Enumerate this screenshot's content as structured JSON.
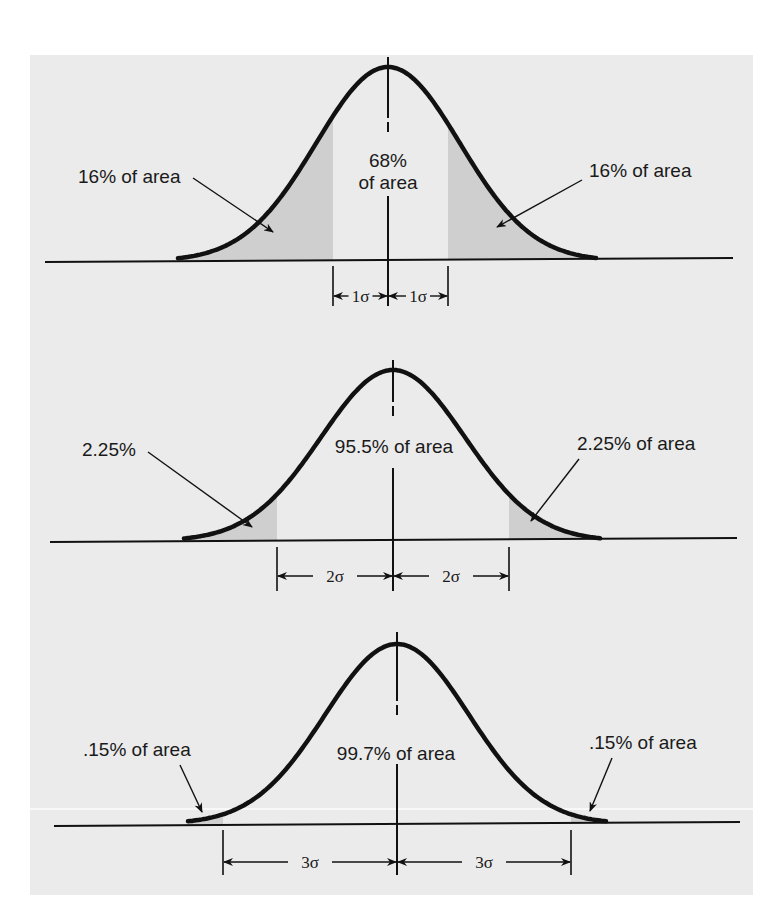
{
  "figure": {
    "colors": {
      "panel_background": "#ebebeb",
      "shaded_tail": "#cfcfcf",
      "ink": "#111111"
    }
  },
  "panels": [
    {
      "id": "one-sigma",
      "sigma_multiple": 1,
      "center_label_lines": [
        "68%",
        "of area"
      ],
      "left_tail_label": "16% of area",
      "right_tail_label": "16% of area",
      "dimension_left_label": "1σ",
      "dimension_right_label": "1σ"
    },
    {
      "id": "two-sigma",
      "sigma_multiple": 2,
      "center_label_lines": [
        "95.5% of area"
      ],
      "left_tail_label": "2.25%",
      "right_tail_label": "2.25% of area",
      "dimension_left_label": "2σ",
      "dimension_right_label": "2σ"
    },
    {
      "id": "three-sigma",
      "sigma_multiple": 3,
      "center_label_lines": [
        "99.7% of area"
      ],
      "left_tail_label": ".15% of area",
      "right_tail_label": ".15% of area",
      "dimension_left_label": "3σ",
      "dimension_right_label": "3σ"
    }
  ],
  "chart_data": {
    "type": "area",
    "xlabel": "",
    "ylabel": "",
    "grid": false,
    "series": [
      {
        "name": "±1σ",
        "center_area_pct": 68,
        "left_tail_pct": 16,
        "right_tail_pct": 16
      },
      {
        "name": "±2σ",
        "center_area_pct": 95.5,
        "left_tail_pct": 2.25,
        "right_tail_pct": 2.25
      },
      {
        "name": "±3σ",
        "center_area_pct": 99.7,
        "left_tail_pct": 0.15,
        "right_tail_pct": 0.15
      }
    ]
  }
}
